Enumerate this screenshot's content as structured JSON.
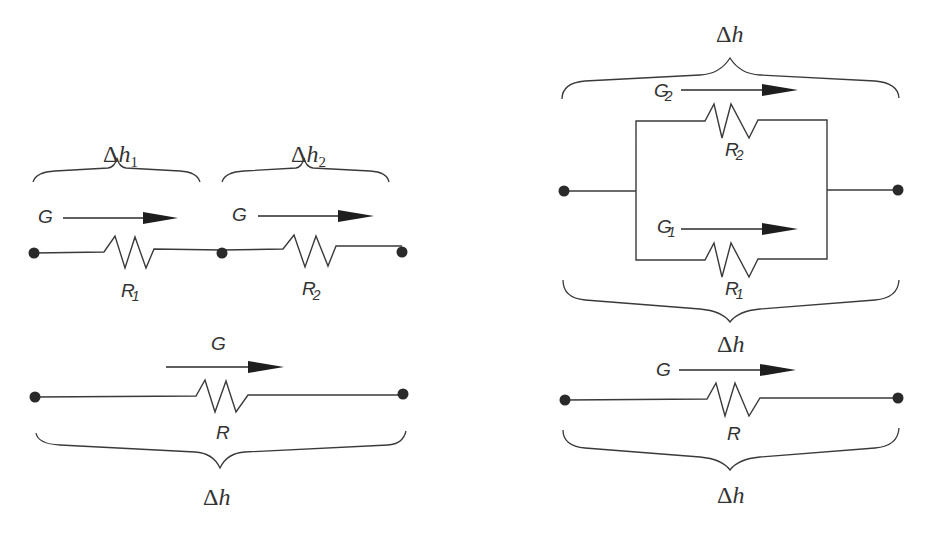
{
  "diagram": {
    "colors": {
      "line": "#3a3a3a",
      "node": "#2a2a2a",
      "text": "#333333",
      "background": "#ffffff"
    },
    "series": {
      "segment1": {
        "brace_label": {
          "delta": "Δ",
          "var": "h",
          "sub": "1"
        },
        "flow_label": "G",
        "resistor": {
          "main": "R",
          "sub": "1"
        }
      },
      "segment2": {
        "brace_label": {
          "delta": "Δ",
          "var": "h",
          "sub": "2"
        },
        "flow_label": "G",
        "resistor": {
          "main": "R",
          "sub": "2"
        }
      }
    },
    "series_equivalent": {
      "flow_label": "G",
      "resistor": "R",
      "brace_label": {
        "delta": "Δ",
        "var": "h"
      }
    },
    "parallel": {
      "top_brace_label": {
        "delta": "Δ",
        "var": "h"
      },
      "branch2": {
        "flow": {
          "main": "G",
          "sub": "2"
        },
        "resistor": {
          "main": "R",
          "sub": "2"
        }
      },
      "branch1": {
        "flow": {
          "main": "G",
          "sub": "1"
        },
        "resistor": {
          "main": "R",
          "sub": "1"
        }
      },
      "bottom_brace_label": {
        "delta": "Δ",
        "var": "h"
      }
    },
    "parallel_equivalent": {
      "flow_label": "G",
      "resistor": "R",
      "brace_label": {
        "delta": "Δ",
        "var": "h"
      }
    }
  }
}
